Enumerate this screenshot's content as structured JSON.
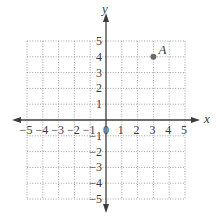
{
  "diagram": {
    "type": "coordinate-plane",
    "x_axis": {
      "label": "x",
      "min": -5,
      "max": 5,
      "ticks": [
        "-5",
        "-4",
        "-3",
        "-2",
        "-1",
        "0",
        "1",
        "2",
        "3",
        "4",
        "5"
      ]
    },
    "y_axis": {
      "label": "y",
      "min": -5,
      "max": 5,
      "ticks_positive": [
        "1",
        "2",
        "3",
        "4",
        "5"
      ],
      "ticks_negative": [
        "-1",
        "-2",
        "-3",
        "-4",
        "-5"
      ]
    },
    "grid": {
      "style": "dotted",
      "step": 1
    },
    "points": [
      {
        "label": "A",
        "x": 3,
        "y": 4
      }
    ]
  },
  "colors": {
    "axis": "#3c3c3c",
    "grid": "#8a8a8a",
    "point": "#6b6b6b",
    "text": "#3a3a3a",
    "background": "#ffffff"
  }
}
